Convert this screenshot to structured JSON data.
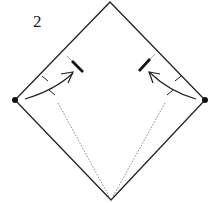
{
  "diagram": {
    "step_number": "2",
    "type": "origami-fold-instruction",
    "elements": [
      {
        "name": "square-paper-outline",
        "shape": "diamond"
      },
      {
        "name": "left-valley-fold-line",
        "style": "dotted"
      },
      {
        "name": "right-valley-fold-line",
        "style": "dotted"
      },
      {
        "name": "left-fold-arrow",
        "from": "left-corner",
        "to": "left-edge-mark"
      },
      {
        "name": "right-fold-arrow",
        "from": "right-corner",
        "to": "right-edge-mark"
      },
      {
        "name": "left-corner-dot"
      },
      {
        "name": "right-corner-dot"
      }
    ],
    "colors": {
      "line": "#222222",
      "fold_line": "#888888",
      "background": "#ffffff"
    }
  }
}
